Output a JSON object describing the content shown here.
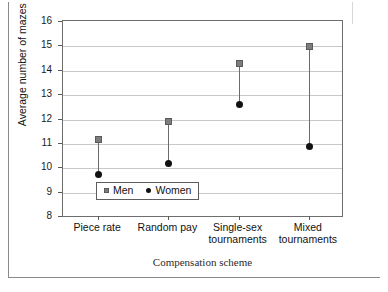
{
  "chart_data": {
    "type": "scatter",
    "subtype": "dumbbell-range-plot",
    "title": "",
    "xlabel": "Compensation scheme",
    "ylabel": "Average number of mazes solved",
    "categories": [
      "Piece rate",
      "Random pay",
      "Single-sex tournaments",
      "Mixed tournaments"
    ],
    "category_lines": [
      [
        "Piece rate"
      ],
      [
        "Random pay"
      ],
      [
        "Single-sex",
        "tournaments"
      ],
      [
        "Mixed",
        "tournaments"
      ]
    ],
    "series": [
      {
        "name": "Men",
        "marker": "square",
        "color": "#7d7d7d",
        "values": [
          11.2,
          11.9,
          14.3,
          15.0
        ]
      },
      {
        "name": "Women",
        "marker": "circle",
        "color": "#111111",
        "values": [
          9.75,
          10.2,
          12.6,
          10.9
        ]
      }
    ],
    "ylim": [
      8,
      16
    ],
    "yticks": [
      8,
      9,
      10,
      11,
      12,
      13,
      14,
      15,
      16
    ],
    "ytick_labels": [
      "8",
      "9",
      "10",
      "11",
      "12",
      "13",
      "14",
      "15",
      "16"
    ],
    "grid": "horizontal",
    "legend_position": "bottom-center",
    "legend_entries": [
      "Men",
      "Women"
    ]
  },
  "legend": {
    "men_label": "Men",
    "women_label": "Women"
  },
  "axes": {
    "y_title": "Average number of mazes solved",
    "x_title": "Compensation scheme"
  }
}
